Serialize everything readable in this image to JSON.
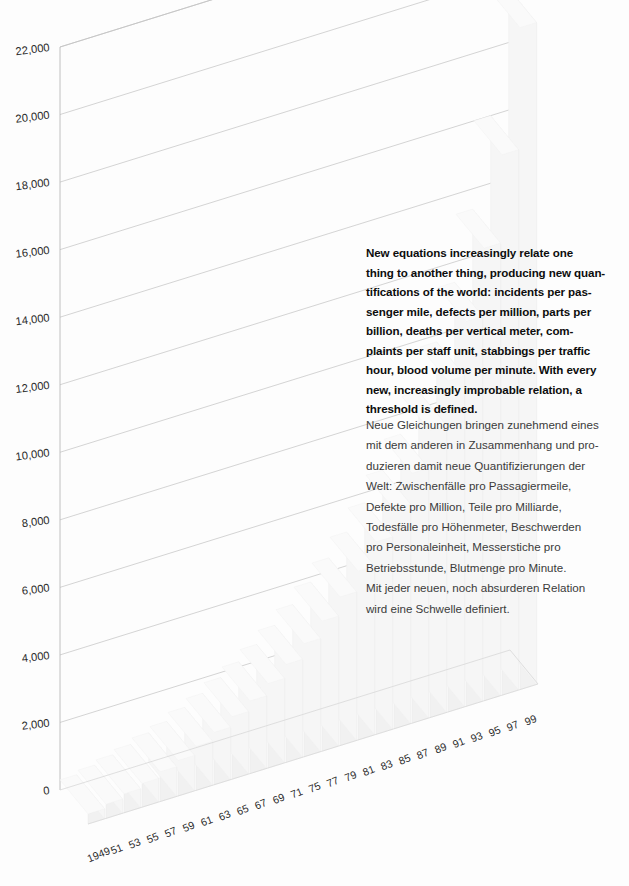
{
  "chart_data": {
    "type": "bar",
    "title": "",
    "subtitle": "",
    "xlabel": "",
    "ylabel": "",
    "ylim": [
      0,
      22000
    ],
    "grid": true,
    "legend_position": "none",
    "projection": "3d-isometric",
    "note": "Pale 3D bars rising from 1949 to 1999; final bar reaches near 20,000",
    "y_ticks": [
      "0",
      "2,000",
      "4,000",
      "6,000",
      "8,000",
      "10,000",
      "12,000",
      "14,000",
      "16,000",
      "18,000",
      "20,000",
      "22,000"
    ],
    "y_tick_values": [
      0,
      2000,
      4000,
      6000,
      8000,
      10000,
      12000,
      14000,
      16000,
      18000,
      20000,
      22000
    ],
    "categories": [
      "1949",
      "51",
      "53",
      "55",
      "57",
      "59",
      "61",
      "63",
      "65",
      "67",
      "69",
      "71",
      "75",
      "77",
      "79",
      "81",
      "83",
      "85",
      "87",
      "89",
      "91",
      "93",
      "95",
      "97",
      "99"
    ],
    "x_tick_labels": [
      "1949",
      "51",
      "53",
      "55",
      "57",
      "59",
      "61",
      "63",
      "65",
      "67",
      "69",
      "71",
      "75",
      "77",
      "79",
      "81",
      "83",
      "85",
      "87",
      "89",
      "91",
      "93",
      "95",
      "97",
      "99"
    ],
    "values": [
      300,
      420,
      560,
      700,
      880,
      1050,
      1300,
      1550,
      1850,
      2150,
      2500,
      2900,
      3350,
      3850,
      4400,
      5000,
      5700,
      6500,
      7400,
      8500,
      9800,
      11400,
      13400,
      16000,
      19600
    ]
  },
  "annotations": {
    "english": {
      "lines": [
        "New equations increasingly relate one",
        "thing to another thing, producing new quan-",
        "tifications of the world: incidents per pas-",
        "senger mile, defects per million, parts per",
        "billion, deaths per vertical meter, com-",
        "plaints per staff unit, stabbings per traffic",
        "hour, blood volume per minute. With every",
        "new, increasingly improbable relation, a",
        "threshold is defined."
      ]
    },
    "german": {
      "lines": [
        "Neue Gleichungen bringen zunehmend eines",
        "mit dem anderen in Zusammenhang und pro-",
        "duzieren damit neue Quantifizierungen der",
        "Welt: Zwischenfälle pro Passagiermeile,",
        "Defekte pro Million, Teile pro Milliarde,",
        "Todesfälle pro Höhenmeter, Beschwerden",
        "pro Personaleinheit, Messerstiche pro",
        "Betriebsstunde, Blutmenge pro Minute.",
        "Mit jeder neuen, noch absurderen Relation",
        "wird eine Schwelle definiert."
      ]
    }
  },
  "colors": {
    "background": "#fdfdfd",
    "gridline": "#c9c9c9",
    "axis": "#b9b9b9",
    "bar_front": "#f1f1f1",
    "bar_top": "#fafafa",
    "bar_side": "#f6f6f6",
    "text_primary": "#0d0d0d",
    "text_secondary": "#3b3b3b"
  }
}
